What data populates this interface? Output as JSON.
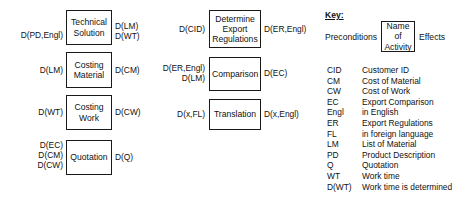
{
  "diagram": {
    "columns": [
      {
        "id": "column-left",
        "activities": [
          {
            "name": "Technical Solution",
            "preconditions": "D(PD,Engl)",
            "effects": "D(LM)\nD(WT)"
          },
          {
            "name": "Costing Material",
            "preconditions": "D(LM)",
            "effects": "D(CM)"
          },
          {
            "name": "Costing Work",
            "preconditions": "D(WT)",
            "effects": "D(CW)"
          },
          {
            "name": "Quotation",
            "preconditions": "D(EC)\nD(CM)\nD(CW)",
            "effects": "D(Q)"
          }
        ]
      },
      {
        "id": "column-middle",
        "activities": [
          {
            "name": "Determine Export Regulations",
            "preconditions": "D(CID)",
            "effects": "D(ER,Engl)"
          },
          {
            "name": "Comparison",
            "preconditions": "D(ER,Engl)\nD(LM)",
            "effects": "D(EC)"
          },
          {
            "name": "Translation",
            "preconditions": "D(x,FL)",
            "effects": "D(x,Engl)"
          }
        ]
      }
    ]
  },
  "key": {
    "title": "Key:",
    "preconditions_label": "Preconditions",
    "activity_box_label": "Name of Activity",
    "effects_label": "Effects",
    "legend": [
      {
        "abbr": "CID",
        "desc": "Customer ID"
      },
      {
        "abbr": "CM",
        "desc": "Cost of Material"
      },
      {
        "abbr": "CW",
        "desc": "Cost of Work"
      },
      {
        "abbr": "EC",
        "desc": "Export Comparison"
      },
      {
        "abbr": "Engl",
        "desc": "in English"
      },
      {
        "abbr": "ER",
        "desc": "Export Regulations"
      },
      {
        "abbr": "FL",
        "desc": "in foreign language"
      },
      {
        "abbr": "LM",
        "desc": "List of Material"
      },
      {
        "abbr": "PD",
        "desc": "Product Description"
      },
      {
        "abbr": "Q",
        "desc": "Quotation"
      },
      {
        "abbr": "WT",
        "desc": "Work time"
      },
      {
        "abbr": "D(WT)",
        "desc": "Work time is determined"
      }
    ]
  },
  "colors": {
    "stroke": "#1a1a1a",
    "text": "#111111",
    "background": "#ffffff"
  }
}
